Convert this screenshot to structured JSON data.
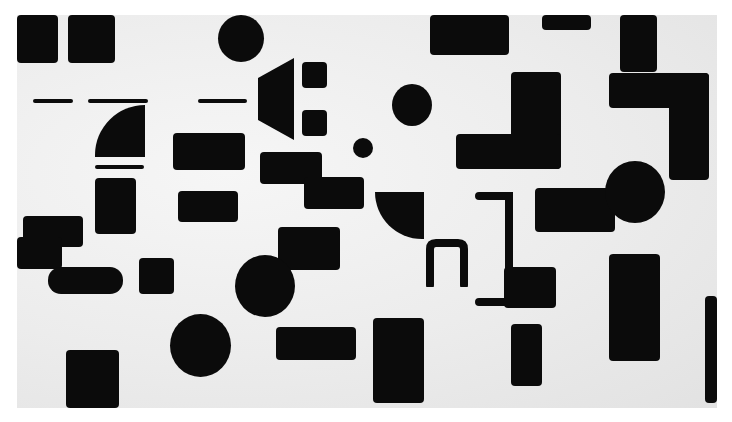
{
  "artwork": {
    "description": "Abstract composition of black geometric shapes on off-white ground",
    "colors": {
      "shape": "#0b0b0b",
      "ground": "#ececec",
      "border": "#ffffff"
    }
  }
}
